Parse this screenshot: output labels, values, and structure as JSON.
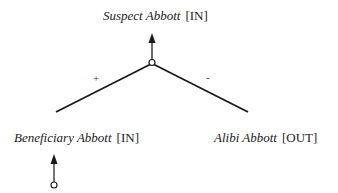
{
  "diagram": {
    "type": "argument-tree",
    "root": {
      "name": "Suspect Abbott",
      "status": "[IN]"
    },
    "children": [
      {
        "name": "Beneficiary Abbott",
        "status": "[IN]",
        "sign": "+"
      },
      {
        "name": "Alibi Abbott",
        "status": "[OUT]",
        "sign": "-"
      }
    ],
    "colors": {
      "line": "#1a1a1a",
      "text": "#222222",
      "background": "#ffffff"
    }
  }
}
